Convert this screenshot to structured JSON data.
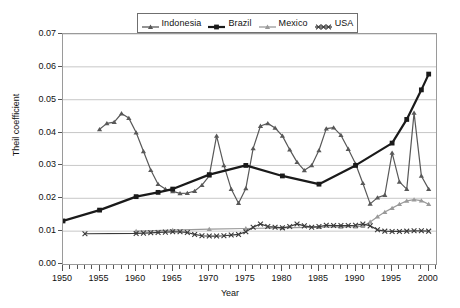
{
  "chart_data": {
    "type": "line",
    "title": "",
    "xlabel": "Year",
    "ylabel": "Theil coefficient",
    "xlim": [
      1950,
      2001
    ],
    "ylim": [
      0.0,
      0.07
    ],
    "ytick_labels": [
      "0.00",
      "0.01",
      "0.02",
      "0.03",
      "0.04",
      "0.05",
      "0.06",
      "0.07"
    ],
    "ytick_values": [
      0.0,
      0.01,
      0.02,
      0.03,
      0.04,
      0.05,
      0.06,
      0.07
    ],
    "xtick_labels": [
      "1950",
      "1955",
      "1960",
      "1965",
      "1970",
      "1975",
      "1980",
      "1985",
      "1990",
      "1995",
      "2000"
    ],
    "xtick_values": [
      1950,
      1955,
      1960,
      1965,
      1970,
      1975,
      1980,
      1985,
      1990,
      1995,
      2000
    ],
    "minor_xticks": true,
    "grid": "horizontal",
    "legend_position": "top-center",
    "series": [
      {
        "name": "Indonesia",
        "color": "#585858",
        "marker": "tri",
        "width": 1.2,
        "x": [
          1955,
          1956,
          1957,
          1958,
          1959,
          1960,
          1961,
          1962,
          1963,
          1964,
          1965,
          1966,
          1967,
          1968,
          1969,
          1970,
          1971,
          1972,
          1973,
          1974,
          1975,
          1976,
          1977,
          1978,
          1979,
          1980,
          1981,
          1982,
          1983,
          1984,
          1985,
          1986,
          1987,
          1988,
          1989,
          1990,
          1991,
          1992,
          1993,
          1994,
          1995,
          1996,
          1997,
          1998,
          1999,
          2000
        ],
        "y": [
          0.041,
          0.0428,
          0.0432,
          0.0458,
          0.0444,
          0.04,
          0.0343,
          0.0286,
          0.0243,
          0.0228,
          0.0221,
          0.0215,
          0.0216,
          0.0222,
          0.024,
          0.0268,
          0.039,
          0.03,
          0.0228,
          0.0185,
          0.023,
          0.0352,
          0.042,
          0.0428,
          0.0414,
          0.039,
          0.0348,
          0.031,
          0.0285,
          0.03,
          0.0346,
          0.0412,
          0.0415,
          0.0392,
          0.035,
          0.0305,
          0.0246,
          0.0183,
          0.0202,
          0.021,
          0.0338,
          0.025,
          0.0228,
          0.046,
          0.0268,
          0.0228
        ]
      },
      {
        "name": "Brazil",
        "color": "#1a1a1a",
        "marker": "square",
        "width": 2.2,
        "x": [
          1950,
          1955,
          1960,
          1963,
          1965,
          1970,
          1975,
          1980,
          1985,
          1990,
          1995,
          1997,
          1999,
          2000
        ],
        "y": [
          0.0131,
          0.0164,
          0.0205,
          0.0218,
          0.0228,
          0.0272,
          0.03,
          0.0268,
          0.0243,
          0.03,
          0.0368,
          0.044,
          0.053,
          0.0578
        ]
      },
      {
        "name": "Mexico",
        "color": "#9a9a9a",
        "marker": "tri",
        "width": 1.2,
        "x": [
          1960,
          1965,
          1970,
          1975,
          1980,
          1985,
          1988,
          1990,
          1991,
          1992,
          1993,
          1994,
          1995,
          1996,
          1997,
          1998,
          1999,
          2000
        ],
        "y": [
          0.01,
          0.0103,
          0.0106,
          0.0108,
          0.011,
          0.0112,
          0.0113,
          0.0114,
          0.0115,
          0.0128,
          0.0144,
          0.0158,
          0.017,
          0.0182,
          0.0192,
          0.0196,
          0.0193,
          0.0182
        ]
      },
      {
        "name": "USA",
        "color": "#3a3a3a",
        "marker": "x",
        "width": 1.2,
        "x": [
          1953,
          1960,
          1961,
          1962,
          1963,
          1964,
          1965,
          1966,
          1967,
          1968,
          1969,
          1970,
          1971,
          1972,
          1973,
          1974,
          1975,
          1976,
          1977,
          1978,
          1979,
          1980,
          1981,
          1982,
          1983,
          1984,
          1985,
          1986,
          1987,
          1988,
          1989,
          1990,
          1991,
          1992,
          1993,
          1994,
          1995,
          1996,
          1997,
          1998,
          1999,
          2000
        ],
        "y": [
          0.0092,
          0.0093,
          0.0094,
          0.0095,
          0.0096,
          0.0097,
          0.0098,
          0.0098,
          0.0096,
          0.009,
          0.0086,
          0.0085,
          0.0085,
          0.0086,
          0.0088,
          0.009,
          0.0098,
          0.0112,
          0.0122,
          0.0114,
          0.0112,
          0.011,
          0.0114,
          0.0122,
          0.0116,
          0.0112,
          0.0114,
          0.0118,
          0.0117,
          0.0117,
          0.0117,
          0.0118,
          0.0122,
          0.0116,
          0.0104,
          0.01,
          0.0099,
          0.0099,
          0.01,
          0.0101,
          0.0101,
          0.01
        ]
      }
    ]
  },
  "legend": {
    "items": [
      {
        "label": "Indonesia",
        "color": "#585858",
        "marker": "tri"
      },
      {
        "label": "Brazil",
        "color": "#1a1a1a",
        "marker": "square"
      },
      {
        "label": "Mexico",
        "color": "#9a9a9a",
        "marker": "tri"
      },
      {
        "label": "USA",
        "color": "#3a3a3a",
        "marker": "x"
      }
    ]
  },
  "axes": {
    "x_title": "Year",
    "y_title": "Theil coefficient"
  }
}
